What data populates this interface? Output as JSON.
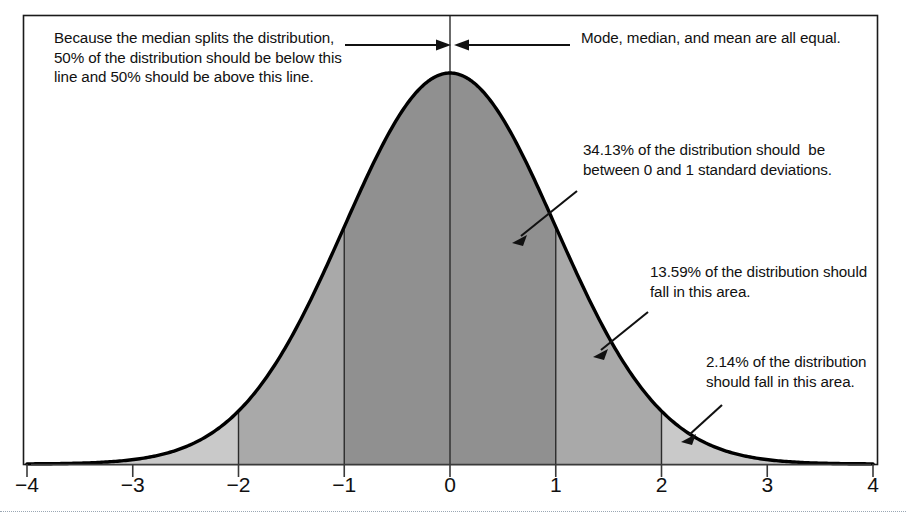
{
  "figure": {
    "border_color": "#1a1a1a",
    "curve_color": "#000000",
    "colors": {
      "band_inner": "#909090",
      "band_middle": "#a9a9a9",
      "band_outer": "#c9c9c9",
      "axis": "#3a3a3a",
      "text": "#111111"
    }
  },
  "annotations": {
    "median": "Because the median splits the distribution, 50% of the distribution should be below this line and 50% should be above this line.",
    "mode": "Mode, median, and mean are all equal.",
    "pct_34": "34.13% of the distribution should  be between 0 and 1 standard deviations.",
    "pct_13": "13.59% of the distribution should fall in this area.",
    "pct_2": "2.14% of the distribution should fall in this area."
  },
  "chart_data": {
    "type": "area",
    "title": "",
    "xlabel": "",
    "ylabel": "",
    "distribution": "standard normal",
    "mean": 0,
    "sd": 1,
    "xlim": [
      -4,
      4
    ],
    "ylim": [
      0,
      0.42
    ],
    "grid": false,
    "legend": null,
    "tick_labels": [
      "-4",
      "-3",
      "-2",
      "-1",
      "0",
      "1",
      "2",
      "3",
      "4"
    ],
    "tick_values": [
      -4,
      -3,
      -2,
      -1,
      0,
      1,
      2,
      3,
      4
    ],
    "x": [
      -4,
      -3.5,
      -3,
      -2.5,
      -2,
      -1.5,
      -1,
      -0.5,
      0,
      0.5,
      1,
      1.5,
      2,
      2.5,
      3,
      3.5,
      4
    ],
    "y": [
      0.0001,
      0.0009,
      0.0044,
      0.0175,
      0.054,
      0.1295,
      0.242,
      0.3521,
      0.3989,
      0.3521,
      0.242,
      0.1295,
      0.054,
      0.0175,
      0.0044,
      0.0009,
      0.0001
    ],
    "vertical_lines": [
      -2,
      -1,
      0,
      1,
      2
    ],
    "center_line": 0,
    "bands": [
      {
        "from": -4,
        "to": -3,
        "percent": 0.14,
        "shade": "#c9c9c9",
        "label": "0.14%"
      },
      {
        "from": -3,
        "to": -2,
        "percent": 2.14,
        "shade": "#c9c9c9",
        "label": "2.14%"
      },
      {
        "from": -2,
        "to": -1,
        "percent": 13.59,
        "shade": "#a9a9a9",
        "label": "13.59%"
      },
      {
        "from": -1,
        "to": 0,
        "percent": 34.13,
        "shade": "#909090",
        "label": "34.13%"
      },
      {
        "from": 0,
        "to": 1,
        "percent": 34.13,
        "shade": "#909090",
        "label": "34.13%"
      },
      {
        "from": 1,
        "to": 2,
        "percent": 13.59,
        "shade": "#a9a9a9",
        "label": "13.59%"
      },
      {
        "from": 2,
        "to": 3,
        "percent": 2.14,
        "shade": "#c9c9c9",
        "label": "2.14%"
      },
      {
        "from": 3,
        "to": 4,
        "percent": 0.14,
        "shade": "#c9c9c9",
        "label": "0.14%"
      }
    ],
    "callouts": [
      {
        "text": "34.13% of the distribution should  be between 0 and 1 standard deviations.",
        "points_to": 0.55
      },
      {
        "text": "13.59% of the distribution should fall in this area.",
        "points_to": 1.5
      },
      {
        "text": "2.14% of the distribution should fall in this area.",
        "points_to": 2.35
      },
      {
        "text": "Mode, median, and mean are all equal.",
        "points_to": 0
      },
      {
        "text": "Because the median splits the distribution, 50% of the distribution should be below this line and 50% should be above this line.",
        "points_to": 0
      }
    ]
  },
  "axis": {
    "ticks": [
      {
        "label": "-4",
        "value": -4
      },
      {
        "label": "-3",
        "value": -3
      },
      {
        "label": "-2",
        "value": -2
      },
      {
        "label": "-1",
        "value": -1
      },
      {
        "label": "0",
        "value": 0
      },
      {
        "label": "1",
        "value": 1
      },
      {
        "label": "2",
        "value": 2
      },
      {
        "label": "3",
        "value": 3
      },
      {
        "label": "4",
        "value": 4
      }
    ]
  }
}
